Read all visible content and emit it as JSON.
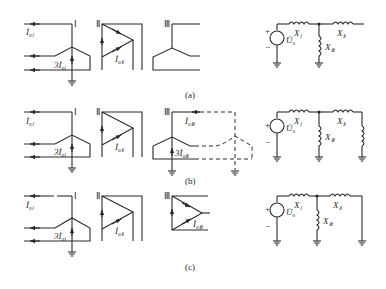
{
  "figure": {
    "panels": [
      {
        "caption": "(a)",
        "winding_labels": {
          "w1": "Ⅰ",
          "w2": "Ⅱ",
          "w3": "Ⅲ"
        },
        "current_labels": {
          "i1": "İ",
          "i1_sub": "0Ⅰ",
          "i1x3": "3İ",
          "i1x3_sub": "0Ⅰ",
          "i2": "İ",
          "i2_sub": "0Ⅱ"
        },
        "equivalent_circuit": {
          "source": "U̇",
          "source_sub": "0",
          "plus": "+",
          "minus": "−",
          "x1": "X",
          "x1_sub": "Ⅰ",
          "x2": "X",
          "x2_sub": "Ⅱ",
          "x3": "X",
          "x3_sub": "Ⅲ"
        }
      },
      {
        "caption": "(b)",
        "winding_labels": {
          "w1": "Ⅰ",
          "w2": "Ⅱ",
          "w3": "Ⅲ"
        },
        "current_labels": {
          "i1": "İ",
          "i1_sub": "0Ⅰ",
          "i1x3": "3İ",
          "i1x3_sub": "0Ⅰ",
          "i2": "İ",
          "i2_sub": "0Ⅱ",
          "i3": "İ",
          "i3_sub": "0Ⅲ",
          "i3x3": "3İ",
          "i3x3_sub": "0Ⅲ"
        },
        "equivalent_circuit": {
          "source": "U̇",
          "source_sub": "0",
          "plus": "+",
          "minus": "−",
          "x1": "X",
          "x1_sub": "Ⅰ",
          "x2": "X",
          "x2_sub": "Ⅱ",
          "x3": "X",
          "x3_sub": "Ⅲ"
        }
      },
      {
        "caption": "(c)",
        "winding_labels": {
          "w1": "Ⅰ",
          "w2": "Ⅱ",
          "w3": "Ⅲ"
        },
        "current_labels": {
          "i1": "İ",
          "i1_sub": "0Ⅰ",
          "i1x3": "3İ",
          "i1x3_sub": "0Ⅰ",
          "i2": "İ",
          "i2_sub": "0Ⅱ",
          "i3": "İ",
          "i3_sub": "0Ⅲ"
        },
        "equivalent_circuit": {
          "source": "U̇",
          "source_sub": "0",
          "plus": "+",
          "minus": "−",
          "x1": "X",
          "x1_sub": "Ⅰ",
          "x2": "X",
          "x2_sub": "Ⅱ",
          "x3": "X",
          "x3_sub": "Ⅲ"
        }
      }
    ]
  }
}
